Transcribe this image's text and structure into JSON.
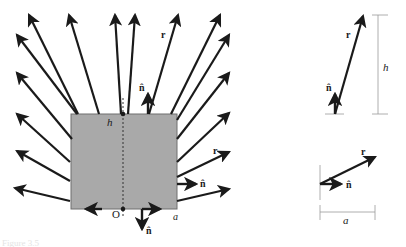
{
  "diagram": {
    "colors": {
      "slab_fill": "#a9a9a9",
      "slab_stroke": "#6e6e6e",
      "arrow": "#1a1a1a",
      "dimension_line": "#9a9a9a",
      "background": "#ffffff"
    },
    "main_figure": {
      "labels": {
        "height": "h",
        "width": "a",
        "origin": "O",
        "r_top": "r",
        "r_right": "r",
        "n_top": "n̂",
        "n_right": "n̂",
        "n_bottom": "n̂"
      }
    },
    "inset_top": {
      "labels": {
        "r": "r",
        "n": "n̂",
        "dimension": "h"
      }
    },
    "inset_bottom": {
      "labels": {
        "r": "r",
        "n": "n̂",
        "dimension": "a"
      }
    },
    "caption": "Figure 3.5"
  }
}
